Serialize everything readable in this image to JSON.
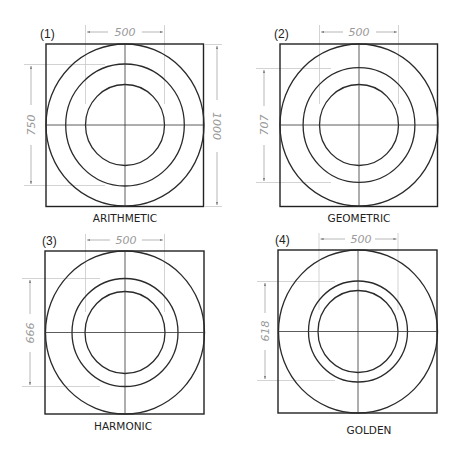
{
  "colors": {
    "stroke": "#222222",
    "dimension": "#9a9a9a",
    "extension": "#c8c8c8",
    "background": "#ffffff"
  },
  "panels": [
    {
      "number": "(1)",
      "caption": "ARITHMETIC",
      "outer_diameter": 1000,
      "inner_diameter": 500,
      "middle_diameter": 750,
      "labels": {
        "inner": "500",
        "middle": "750",
        "outer": "1000"
      }
    },
    {
      "number": "(2)",
      "caption": "GEOMETRIC",
      "outer_diameter": 1000,
      "inner_diameter": 500,
      "middle_diameter": 707,
      "labels": {
        "inner": "500",
        "middle": "707"
      }
    },
    {
      "number": "(3)",
      "caption": "HARMONIC",
      "outer_diameter": 1000,
      "inner_diameter": 500,
      "middle_diameter": 666,
      "labels": {
        "inner": "500",
        "middle": "666"
      }
    },
    {
      "number": "(4)",
      "caption": "GOLDEN",
      "outer_diameter": 1000,
      "inner_diameter": 500,
      "middle_diameter": 618,
      "labels": {
        "inner": "500",
        "middle": "618"
      }
    }
  ]
}
